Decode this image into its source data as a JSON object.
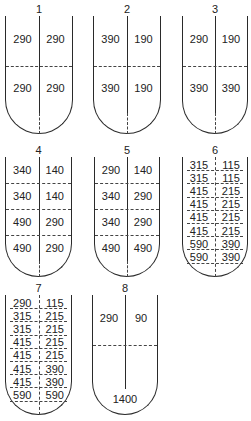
{
  "tubes": [
    {
      "id": "1",
      "x": 5,
      "y": 16,
      "w": 68,
      "h": 118,
      "rows": [
        [
          "290",
          "290"
        ],
        [
          "290",
          "290"
        ]
      ],
      "label_y": 3,
      "layout": "halves"
    },
    {
      "id": "2",
      "x": 93,
      "y": 16,
      "w": 68,
      "h": 118,
      "rows": [
        [
          "390",
          "190"
        ],
        [
          "390",
          "190"
        ]
      ],
      "label_y": 3,
      "layout": "halves"
    },
    {
      "id": "3",
      "x": 182,
      "y": 16,
      "w": 66,
      "h": 118,
      "rows": [
        [
          "290",
          "190"
        ],
        [
          "390",
          "390"
        ]
      ],
      "label_y": 3,
      "layout": "halves"
    },
    {
      "id": "4",
      "x": 5,
      "y": 157,
      "w": 67,
      "h": 120,
      "rows": [
        [
          "340",
          "140"
        ],
        [
          "340",
          "140"
        ],
        [
          "490",
          "290"
        ],
        [
          "490",
          "290"
        ]
      ],
      "label_y": 144,
      "layout": "quarters"
    },
    {
      "id": "5",
      "x": 94,
      "y": 157,
      "w": 66,
      "h": 120,
      "rows": [
        [
          "290",
          "140"
        ],
        [
          "340",
          "290"
        ],
        [
          "340",
          "290"
        ],
        [
          "490",
          "490"
        ]
      ],
      "label_y": 144,
      "layout": "quarters"
    },
    {
      "id": "6",
      "x": 182,
      "y": 157,
      "w": 66,
      "h": 120,
      "rows": [
        [
          "315",
          "115"
        ],
        [
          "315",
          "115"
        ],
        [
          "415",
          "215"
        ],
        [
          "415",
          "215"
        ],
        [
          "415",
          "215"
        ],
        [
          "415",
          "215"
        ],
        [
          "590",
          "390"
        ],
        [
          "590",
          "390"
        ]
      ],
      "label_y": 144,
      "layout": "eighths"
    },
    {
      "id": "7",
      "x": 5,
      "y": 295,
      "w": 67,
      "h": 120,
      "rows": [
        [
          "290",
          "115"
        ],
        [
          "315",
          "215"
        ],
        [
          "315",
          "215"
        ],
        [
          "415",
          "215"
        ],
        [
          "415",
          "215"
        ],
        [
          "415",
          "390"
        ],
        [
          "415",
          "390"
        ],
        [
          "590",
          "590"
        ]
      ],
      "label_y": 282,
      "layout": "eighths"
    },
    {
      "id": "8",
      "x": 92,
      "y": 295,
      "w": 66,
      "h": 120,
      "rows": [
        [
          "290",
          "90"
        ]
      ],
      "bottom": "1400",
      "label_y": 282,
      "layout": "special"
    }
  ]
}
